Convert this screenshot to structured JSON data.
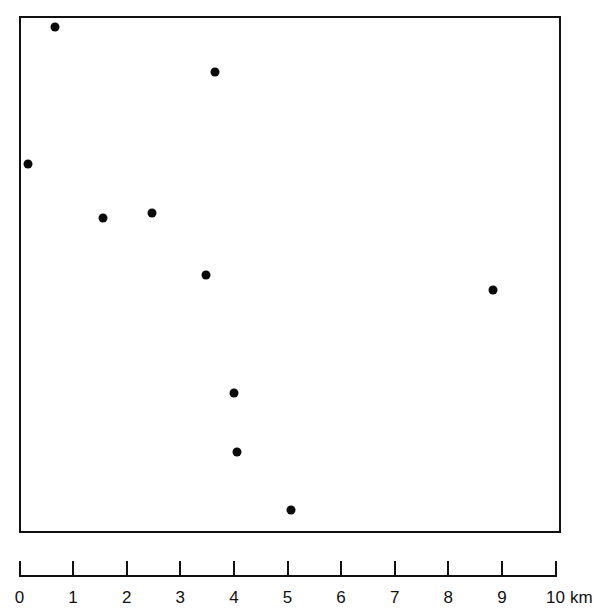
{
  "chart_data": {
    "type": "scatter",
    "title": "",
    "xlabel": "km",
    "ylabel": "",
    "grid": false,
    "legend": null,
    "scale_bar": {
      "ticks": [
        "0",
        "1",
        "2",
        "3",
        "4",
        "5",
        "6",
        "7",
        "8",
        "9",
        "10"
      ],
      "unit": "km",
      "range_km": [
        0,
        10
      ]
    },
    "area_km": {
      "width": 10,
      "height": 9.6
    },
    "points": [
      {
        "id": 1,
        "x_km": 0.66,
        "y_km_from_top": 0.19,
        "px": 55,
        "py": 27
      },
      {
        "id": 2,
        "x_km": 3.65,
        "y_km_from_top": 1.03,
        "px": 215,
        "py": 72
      },
      {
        "id": 3,
        "x_km": 0.16,
        "y_km_from_top": 2.74,
        "px": 28,
        "py": 164
      },
      {
        "id": 4,
        "x_km": 1.56,
        "y_km_from_top": 3.75,
        "px": 103,
        "py": 218
      },
      {
        "id": 5,
        "x_km": 2.47,
        "y_km_from_top": 3.66,
        "px": 152,
        "py": 213
      },
      {
        "id": 6,
        "x_km": 3.48,
        "y_km_from_top": 4.81,
        "px": 206,
        "py": 275
      },
      {
        "id": 7,
        "x_km": 8.83,
        "y_km_from_top": 5.09,
        "px": 493,
        "py": 290
      },
      {
        "id": 8,
        "x_km": 4.0,
        "y_km_from_top": 7.01,
        "px": 234,
        "py": 393
      },
      {
        "id": 9,
        "x_km": 4.06,
        "y_km_from_top": 8.12,
        "px": 237,
        "py": 452
      },
      {
        "id": 10,
        "x_km": 5.07,
        "y_km_from_top": 9.2,
        "px": 291,
        "py": 510
      }
    ]
  },
  "scale": {
    "labels": [
      "0",
      "1",
      "2",
      "3",
      "4",
      "5",
      "6",
      "7",
      "8",
      "9",
      "10"
    ],
    "unit": "km"
  },
  "colors": {
    "ink": "#111111",
    "point": "#0a0a0a",
    "background": "#ffffff"
  }
}
